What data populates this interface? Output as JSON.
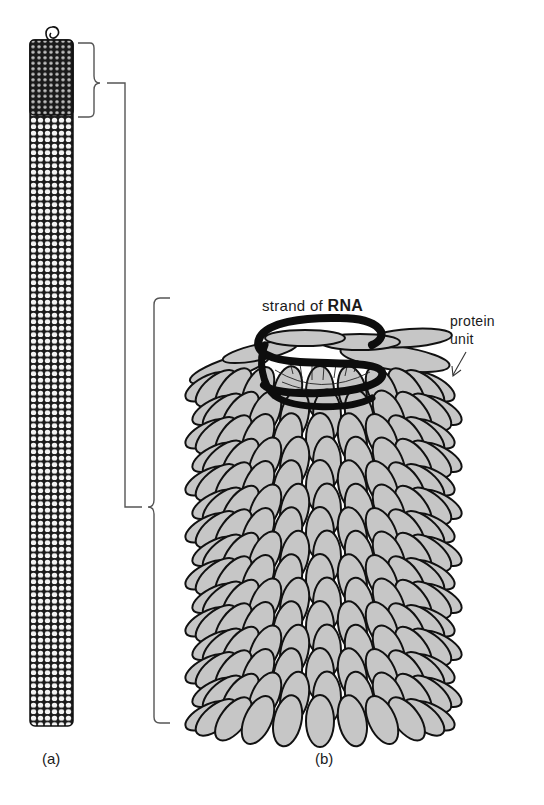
{
  "figure": {
    "panels": [
      {
        "id": "a",
        "label": "(a)",
        "description": "full-length rod of virus particle"
      },
      {
        "id": "b",
        "label": "(b)",
        "description": "enlarged segment of rod"
      }
    ],
    "labels": {
      "rna_prefix": "strand of ",
      "rna_bold": "RNA",
      "protein_line1": "protein",
      "protein_line2": "unit"
    },
    "colors": {
      "background": "#ffffff",
      "outline": "#111111",
      "protein_fill": "#c6c6c6",
      "rna": "#0d0d0d",
      "bracket": "#555555"
    }
  }
}
